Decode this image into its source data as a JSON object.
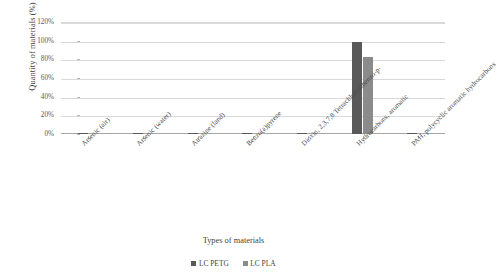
{
  "chart_data": {
    "type": "bar",
    "title": "",
    "xlabel": "Types of materials",
    "ylabel": "Quantity of materials (%)",
    "ylim": [
      0,
      120
    ],
    "ytick_labels": [
      "120%",
      "100%",
      "80%",
      "60%",
      "40%",
      "20%",
      "0%"
    ],
    "ytick_values": [
      120,
      100,
      80,
      60,
      40,
      20,
      0
    ],
    "grid": true,
    "legend_position": "bottom",
    "categories": [
      "Arsenic (air)",
      "Arsenic (water)",
      "Atrazine (land)",
      "Benzo(a)pyrene",
      "Dioxin, 2,3,7,8 Tetrachlorodibenzo-p-",
      "Hydrocarbons, aromatic",
      "PAH, polycyclic aromatic hydrocarbons"
    ],
    "series": [
      {
        "name": "LC PETG",
        "color": "#595959",
        "values": [
          0.4,
          1.2,
          1.2,
          1.2,
          0.6,
          99.0,
          0.6
        ]
      },
      {
        "name": "LC PLA",
        "color": "#8b8b8b",
        "values": [
          0.0,
          0.0,
          0.0,
          0.0,
          0.0,
          82.0,
          0.0
        ]
      }
    ]
  },
  "axes": {
    "y_title": "Quantity of materials (%)",
    "x_title": "Types of materials"
  },
  "legend": {
    "items": [
      {
        "label": "LC PETG",
        "color": "#595959"
      },
      {
        "label": "LC PLA",
        "color": "#8b8b8b"
      }
    ]
  }
}
